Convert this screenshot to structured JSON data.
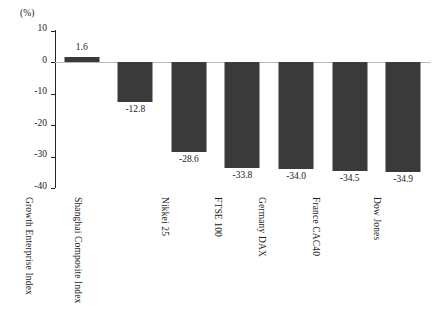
{
  "chart_data": {
    "type": "bar",
    "title": "",
    "subtitle": "",
    "xlabel": "",
    "ylabel": "(%)",
    "unit_caption": "(%)",
    "categories": [
      "Growth Enterprise Index",
      "Shanghai Composite Index",
      "Nikkei 25",
      "FTSE 100",
      "Germany DAX",
      "France CAC40",
      "Dow Jones"
    ],
    "values": [
      1.6,
      -12.8,
      -28.6,
      -33.8,
      -34.0,
      -34.5,
      -34.9
    ],
    "value_labels": [
      "1.6",
      "-12.8",
      "-28.6",
      "-33.8",
      "-34.0",
      "-34.5",
      "-34.9"
    ],
    "ylim": [
      -40,
      10
    ],
    "yticks": [
      10,
      0,
      -10,
      -20,
      -30,
      -40
    ],
    "ytick_labels": [
      "10",
      "0",
      "-10",
      "-20",
      "-30",
      "-40"
    ],
    "grid": false,
    "legend": false,
    "legend_position": "none",
    "bar_color": "#3a3a3a",
    "axis_color": "#262626",
    "zero_line_color": "#b9b9b9",
    "background_color": "#ffffff"
  }
}
